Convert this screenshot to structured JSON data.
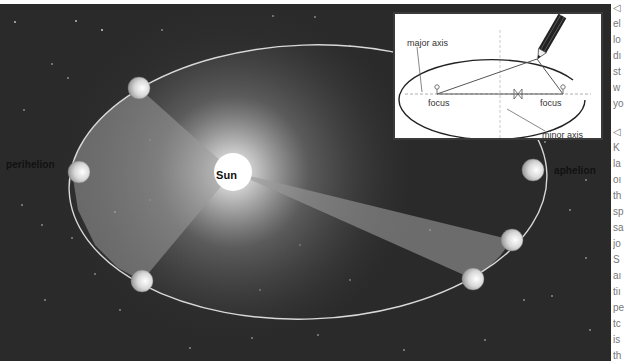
{
  "diagram": {
    "labels": {
      "perihelion": "perihelion",
      "aphelion": "aphelion",
      "sun": "Sun"
    },
    "inset": {
      "major_axis": "major axis",
      "minor_axis": "minor axis",
      "focus_left": "focus",
      "focus_right": "focus"
    },
    "colors": {
      "space": "#2a2a2a",
      "orbit": "#d8d8d8",
      "wedge": "#8a8a8a",
      "sun": "#ffffff",
      "inset_bg": "#ffffff"
    },
    "planets": [
      {
        "name": "perihelion-planet",
        "cx": 79,
        "cy": 172
      },
      {
        "name": "planet-top-left",
        "cx": 139,
        "cy": 88
      },
      {
        "name": "planet-bottom-left",
        "cx": 142,
        "cy": 281
      },
      {
        "name": "planet-right-upper",
        "cx": 512,
        "cy": 240
      },
      {
        "name": "planet-right-lower",
        "cx": 473,
        "cy": 279
      },
      {
        "name": "aphelion-planet",
        "cx": 533,
        "cy": 170
      }
    ]
  },
  "side_text": {
    "lines_top": [
      "◁",
      "el",
      "lo",
      "dı",
      "st",
      "w",
      "yo"
    ],
    "lines_bottom": [
      "◁",
      "K",
      "la",
      "oı",
      "th",
      "sp",
      "sa",
      "jo",
      "S",
      "aı",
      "tiı",
      "pe",
      "tc",
      "is",
      "th"
    ]
  }
}
